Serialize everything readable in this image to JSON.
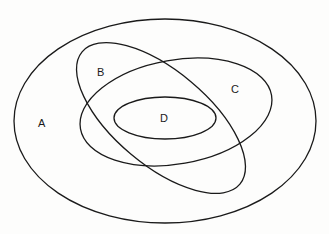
{
  "diagram": {
    "type": "venn-euler",
    "colors": {
      "stroke": "#1a1a1a",
      "background": "#fdfdfc",
      "label": "#1a1a1a"
    },
    "sets": [
      {
        "id": "A",
        "label": "A",
        "cx": 165,
        "cy": 121,
        "rx": 151,
        "ry": 102,
        "rotate": 0,
        "label_x": 42,
        "label_y": 127
      },
      {
        "id": "B",
        "label": "B",
        "cx": 161,
        "cy": 118,
        "rx": 103,
        "ry": 47,
        "rotate": 40,
        "label_x": 101,
        "label_y": 76
      },
      {
        "id": "C",
        "label": "C",
        "cx": 176,
        "cy": 112,
        "rx": 97,
        "ry": 52,
        "rotate": -10,
        "label_x": 235,
        "label_y": 93
      },
      {
        "id": "D",
        "label": "D",
        "cx": 165,
        "cy": 118,
        "rx": 51,
        "ry": 21,
        "rotate": 0,
        "label_x": 164,
        "label_y": 122
      }
    ]
  }
}
